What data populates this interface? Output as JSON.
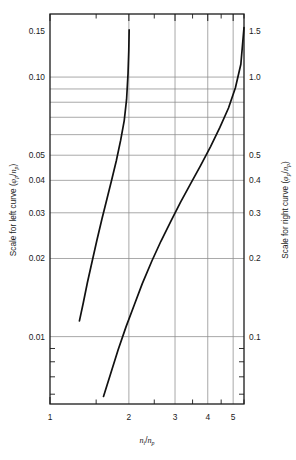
{
  "figure": {
    "background": "#ffffff",
    "frame_color": "#1a1a1a",
    "grid_color": "#8c8c8c",
    "curve_color": "#111111"
  },
  "axis_titles": {
    "x": "n_i/n_p",
    "x_parts": {
      "n1": "n",
      "sub1": "i",
      "slash": "/",
      "n2": "n",
      "sub2": "p"
    },
    "left": "Scale for left curve (φ_p/n_p)",
    "left_parts": {
      "text": "Scale for left curve (",
      "phi": "φ",
      "sub1": "p",
      "slash": "/",
      "n": "n",
      "sub2": "p",
      "close": ")"
    },
    "right": "Scale for right curve (φ_p/n_p)",
    "right_parts": {
      "text": "Scale for right curve (",
      "phi": "φ",
      "sub1": "p",
      "slash": "/",
      "n": "n",
      "sub2": "p",
      "close": ")"
    }
  },
  "chart_data": {
    "type": "line",
    "title": "",
    "xlabel": "n_i/n_p",
    "ylabel": "Scale for left curve (φ_p/n_p)",
    "y2label": "Scale for right curve (φ_p/n_p)",
    "xscale": "log",
    "yscale": "log",
    "xlim": [
      1.0,
      5.5
    ],
    "ylim": [
      0.0055,
      0.175
    ],
    "y2lim": [
      0.055,
      1.75
    ],
    "grid": true,
    "legend": "none",
    "x_ticks_major": [
      1,
      2,
      3,
      4,
      5
    ],
    "x_tick_labels": [
      "1",
      "2",
      "3",
      "4",
      "5"
    ],
    "x_gridlines": [
      2,
      3,
      4,
      5
    ],
    "y_left_ticks": [
      0.01,
      0.02,
      0.03,
      0.04,
      0.05,
      0.06,
      0.07,
      0.08,
      0.09,
      0.1,
      0.15
    ],
    "y_left_tick_labels": [
      "0.01",
      "0.02",
      "0.03",
      "0.04",
      "0.05",
      "",
      "",
      "",
      "",
      "0.10",
      "0.15"
    ],
    "y_left_labeled": [
      "0.01",
      "0.02",
      "0.03",
      "0.04",
      "0.05",
      "0.10",
      "0.15"
    ],
    "y_right_ticks": [
      0.1,
      0.2,
      0.3,
      0.4,
      0.5,
      0.6,
      0.7,
      0.8,
      0.9,
      1.0,
      1.5
    ],
    "y_right_labeled": [
      "0.1",
      "0.2",
      "0.3",
      "0.4",
      "0.5",
      "1.0",
      "1.5"
    ],
    "series": [
      {
        "name": "left curve",
        "axis": "left",
        "points": [
          [
            1.295,
            0.0115
          ],
          [
            1.34,
            0.0135
          ],
          [
            1.39,
            0.0162
          ],
          [
            1.45,
            0.0196
          ],
          [
            1.51,
            0.0235
          ],
          [
            1.58,
            0.0285
          ],
          [
            1.65,
            0.034
          ],
          [
            1.72,
            0.0402
          ],
          [
            1.79,
            0.0475
          ],
          [
            1.86,
            0.057
          ],
          [
            1.92,
            0.068
          ],
          [
            1.96,
            0.082
          ],
          [
            1.985,
            0.103
          ],
          [
            1.998,
            0.126
          ],
          [
            2.005,
            0.152
          ]
        ]
      },
      {
        "name": "right curve",
        "axis": "right",
        "points": [
          [
            1.6,
            0.0588
          ],
          [
            1.7,
            0.0715
          ],
          [
            1.82,
            0.089
          ],
          [
            1.95,
            0.109
          ],
          [
            2.1,
            0.133
          ],
          [
            2.25,
            0.16
          ],
          [
            2.45,
            0.196
          ],
          [
            2.65,
            0.233
          ],
          [
            2.9,
            0.28
          ],
          [
            3.15,
            0.33
          ],
          [
            3.45,
            0.39
          ],
          [
            3.75,
            0.455
          ],
          [
            4.1,
            0.54
          ],
          [
            4.45,
            0.64
          ],
          [
            4.8,
            0.76
          ],
          [
            5.1,
            0.91
          ],
          [
            5.35,
            1.12
          ],
          [
            5.5,
            1.55
          ]
        ]
      }
    ]
  }
}
